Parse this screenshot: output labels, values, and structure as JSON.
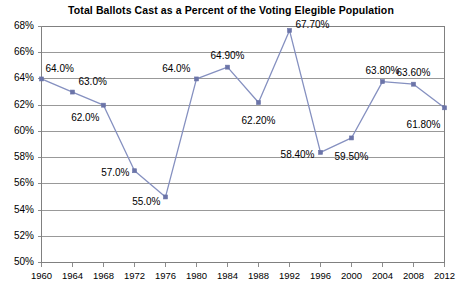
{
  "chart_data": {
    "type": "line",
    "title": "Total Ballots Cast as a Percent of the Voting Elegible Population",
    "xlabel": "",
    "ylabel": "",
    "x": [
      1960,
      1964,
      1968,
      1972,
      1976,
      1980,
      1984,
      1988,
      1992,
      1996,
      2000,
      2004,
      2008,
      2012
    ],
    "values": [
      64.0,
      63.0,
      62.0,
      57.0,
      55.0,
      64.0,
      64.9,
      62.2,
      67.7,
      58.4,
      59.5,
      63.8,
      63.6,
      61.8
    ],
    "point_labels": [
      "64.0%",
      "63.0%",
      "62.0%",
      "57.0%",
      "55.0%",
      "64.0%",
      "64.90%",
      "62.20%",
      "67.70%",
      "58.40%",
      "59.50%",
      "63.80%",
      "63.60%",
      "61.80%"
    ],
    "x_tick_labels": [
      "1960",
      "1964",
      "1968",
      "1972",
      "1976",
      "1980",
      "1984",
      "1988",
      "1992",
      "1996",
      "2000",
      "2004",
      "2008",
      "2012"
    ],
    "y_tick_labels": [
      "68%",
      "66%",
      "64%",
      "62%",
      "60%",
      "58%",
      "56%",
      "54%",
      "52%",
      "50%"
    ],
    "y_ticks": [
      68,
      66,
      64,
      62,
      60,
      58,
      56,
      54,
      52,
      50
    ],
    "ylim": [
      50,
      68
    ],
    "xlim": [
      1960,
      2012
    ],
    "grid": "horizontal",
    "legend": "none",
    "series_name": "Total Ballots Cast",
    "colors": {
      "line": "#8590c0",
      "marker": "#6b74a8",
      "grid": "#808080",
      "axis": "#808080",
      "text": "#000000",
      "background": "#ffffff"
    },
    "label_placement": [
      {
        "dx": 4,
        "dy": -10,
        "anchor": "start"
      },
      {
        "dx": 6,
        "dy": -10,
        "anchor": "start"
      },
      {
        "dx": -4,
        "dy": 13,
        "anchor": "end"
      },
      {
        "dx": -5,
        "dy": 2,
        "anchor": "end"
      },
      {
        "dx": -5,
        "dy": 5,
        "anchor": "end"
      },
      {
        "dx": -6,
        "dy": -10,
        "anchor": "end"
      },
      {
        "dx": 0,
        "dy": -11,
        "anchor": "middle"
      },
      {
        "dx": 0,
        "dy": 18,
        "anchor": "middle"
      },
      {
        "dx": 6,
        "dy": -5,
        "anchor": "start"
      },
      {
        "dx": -6,
        "dy": 3,
        "anchor": "end"
      },
      {
        "dx": 0,
        "dy": 19,
        "anchor": "middle"
      },
      {
        "dx": 0,
        "dy": -11,
        "anchor": "middle"
      },
      {
        "dx": 0,
        "dy": -11,
        "anchor": "middle"
      },
      {
        "dx": -4,
        "dy": 17,
        "anchor": "end"
      }
    ]
  }
}
